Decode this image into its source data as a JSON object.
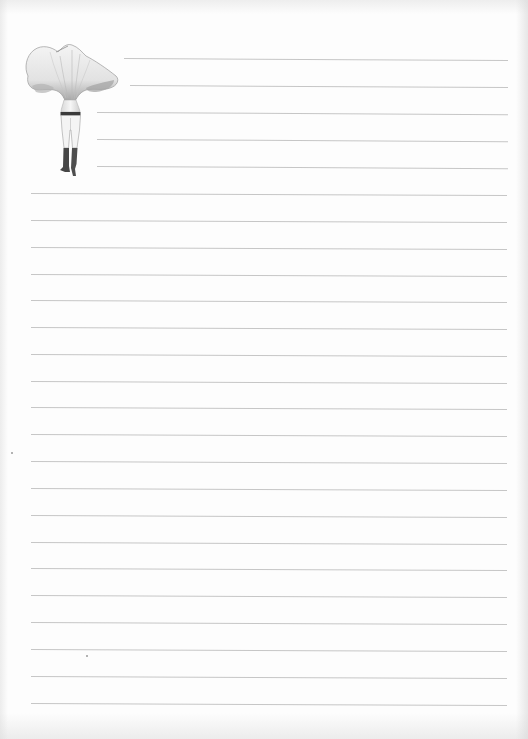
{
  "page": {
    "type": "lined-notepaper",
    "width": 528,
    "height": 739,
    "background_color": "#fdfdfd",
    "line_color": "#c6c6c6"
  },
  "illustration": {
    "subject": "mushroom-headed-figure-icon",
    "description": "Pencil sketch of a human figure whose head is a large chanterelle-like mushroom cap, wearing dark waistband, light shorts and dark boots",
    "colors": {
      "cap_shade": "#8a8a8a",
      "cap_light": "#eeeeee",
      "band": "#3a3a3a",
      "boots": "#4a4a4a"
    }
  },
  "short_lines": [
    {
      "x1": 124,
      "x2": 508,
      "y": 58
    },
    {
      "x1": 130,
      "x2": 508,
      "y": 85
    },
    {
      "x1": 97,
      "x2": 508,
      "y": 112
    },
    {
      "x1": 97,
      "x2": 508,
      "y": 139
    },
    {
      "x1": 97,
      "x2": 508,
      "y": 166
    }
  ],
  "full_lines": {
    "x1": 31,
    "x2": 507,
    "y_positions": [
      193,
      220,
      247,
      274,
      300,
      327,
      354,
      381,
      407,
      434,
      461,
      488,
      515,
      542,
      568,
      595,
      622,
      649,
      676,
      703
    ]
  },
  "specks": [
    {
      "x": 86,
      "y": 655
    },
    {
      "x": 11,
      "y": 452
    }
  ]
}
